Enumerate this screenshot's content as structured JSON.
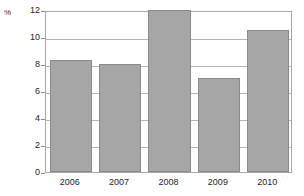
{
  "chart_data": {
    "type": "bar",
    "title": "",
    "subtitle": "",
    "xlabel": "",
    "ylabel": "%",
    "categories": [
      "2006",
      "2007",
      "2008",
      "2009",
      "2010"
    ],
    "values": [
      8.3,
      8.0,
      12.0,
      7.0,
      10.5
    ],
    "ylim": [
      0,
      12
    ],
    "ytick_labels": [
      "0",
      "2",
      "4",
      "6",
      "8",
      "10",
      "12"
    ],
    "ytick_values": [
      0,
      2,
      4,
      6,
      8,
      10,
      12
    ],
    "grid": true,
    "grid_axis": "y",
    "legend": false,
    "legend_position": "none",
    "annotations": [],
    "colors": {
      "bar_fill": "#a6a6a6",
      "bar_border": "#8a8a8a",
      "gridline": "#b4b4b4",
      "frame": "#a8a8a8",
      "background": "#ffffff",
      "text": "#1e1e1e"
    }
  }
}
